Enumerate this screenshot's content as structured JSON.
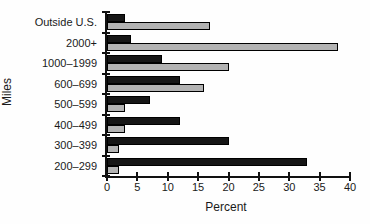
{
  "chart_data": {
    "type": "bar",
    "orientation": "horizontal",
    "title": "",
    "xlabel": "Percent",
    "ylabel": "Miles",
    "categories": [
      "Outside U.S.",
      "2000+",
      "1000–1999",
      "600–699",
      "500–599",
      "400–499",
      "300–399",
      "200–299"
    ],
    "series": [
      {
        "name": "black",
        "color": "#161616",
        "values": [
          3,
          4,
          9,
          12,
          7,
          12,
          20,
          33
        ]
      },
      {
        "name": "gray",
        "color": "#b3b3b3",
        "values": [
          17,
          38,
          20,
          16,
          3,
          3,
          2,
          2
        ]
      }
    ],
    "xlim": [
      0,
      40
    ],
    "xticks": [
      0,
      5,
      10,
      15,
      20,
      25,
      30,
      35,
      40
    ],
    "grid": false,
    "legend_visible": false
  }
}
